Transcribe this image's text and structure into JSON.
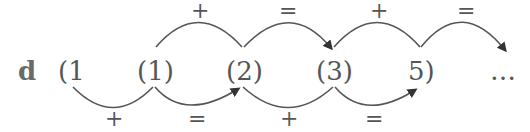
{
  "diagram": {
    "part_label": "d",
    "terms": [
      "(1",
      "(1)",
      "(2)",
      "(3)",
      "5)",
      "…"
    ],
    "top_ops": [
      "+",
      "=",
      "+",
      "="
    ],
    "bottom_ops": [
      "+",
      "=",
      "+",
      "="
    ],
    "colors": {
      "stroke": "#555555",
      "arrow": "#333333"
    }
  }
}
